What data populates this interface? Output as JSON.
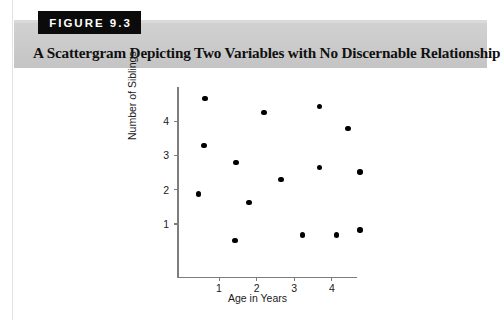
{
  "figure": {
    "badge_label": "FIGURE 9.3",
    "title": "A Scattergram Depicting Two Variables with No Discernable Relationship"
  },
  "chart_data": {
    "type": "scatter",
    "title": "A Scattergram Depicting Two Variables with No Discernable Relationship",
    "xlabel": "Age in Years",
    "ylabel": "Number of Siblings",
    "xticks": [
      "1",
      "2",
      "3",
      "4"
    ],
    "xtick_values": [
      1,
      2,
      3,
      4
    ],
    "yticks": [
      "1",
      "2",
      "3",
      "4"
    ],
    "ytick_values": [
      1,
      2,
      3,
      4
    ],
    "xlim": [
      0.0,
      4.8
    ],
    "ylim": [
      0.25,
      4.95
    ],
    "grid": false,
    "legend": null,
    "marker": "filled-circle",
    "marker_color": "#000000",
    "points": [
      {
        "x": 0.63,
        "y": 4.65
      },
      {
        "x": 0.6,
        "y": 3.28
      },
      {
        "x": 0.45,
        "y": 1.88
      },
      {
        "x": 1.45,
        "y": 2.8
      },
      {
        "x": 1.8,
        "y": 1.63
      },
      {
        "x": 1.43,
        "y": 0.52
      },
      {
        "x": 2.2,
        "y": 4.25
      },
      {
        "x": 2.65,
        "y": 2.3
      },
      {
        "x": 3.22,
        "y": 0.68
      },
      {
        "x": 3.68,
        "y": 4.42
      },
      {
        "x": 3.68,
        "y": 2.65
      },
      {
        "x": 4.12,
        "y": 0.68
      },
      {
        "x": 4.43,
        "y": 3.78
      },
      {
        "x": 4.75,
        "y": 2.52
      },
      {
        "x": 4.75,
        "y": 0.82
      }
    ]
  },
  "axes_pixels": {
    "x_origin": 177,
    "y_origin": 276.5,
    "x_unit_px": 37.6,
    "y_unit_px": 34.3,
    "x_tick_one_px": 219,
    "y_tick_one_px": 224
  }
}
